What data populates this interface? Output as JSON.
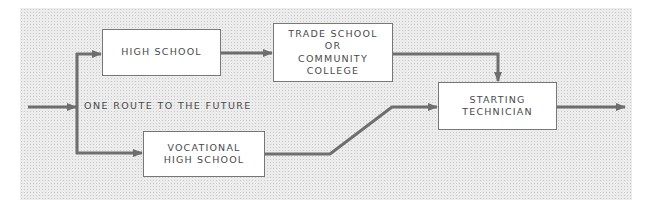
{
  "diagram": {
    "type": "flowchart",
    "caption_label": "ONE ROUTE TO THE FUTURE",
    "colors": {
      "arrow": "#6e6e6e",
      "box_border": "#777777",
      "box_fill": "#ffffff",
      "text": "#4a4a4a",
      "background_stipple": "#ececec"
    },
    "nodes": {
      "high_school": {
        "lines": [
          "HIGH SCHOOL"
        ]
      },
      "trade_school": {
        "lines": [
          "TRADE SCHOOL",
          "OR",
          "COMMUNITY",
          "COLLEGE"
        ]
      },
      "vocational": {
        "lines": [
          "VOCATIONAL",
          "HIGH SCHOOL"
        ]
      },
      "starting_technician": {
        "lines": [
          "STARTING",
          "TECHNICIAN"
        ]
      }
    },
    "edges": [
      {
        "from": "entry",
        "to": "branch"
      },
      {
        "from": "branch",
        "to": "high_school"
      },
      {
        "from": "branch",
        "to": "vocational"
      },
      {
        "from": "high_school",
        "to": "trade_school"
      },
      {
        "from": "trade_school",
        "to": "starting_technician"
      },
      {
        "from": "vocational",
        "to": "starting_technician"
      },
      {
        "from": "starting_technician",
        "to": "exit"
      }
    ]
  }
}
